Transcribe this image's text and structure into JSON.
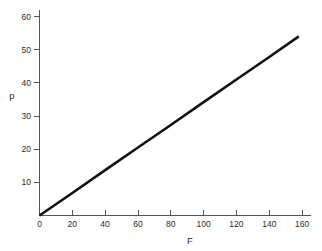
{
  "chart_data": {
    "type": "line",
    "title": "",
    "subtitle": "",
    "xlabel": "F",
    "ylabel": "p",
    "xlim": [
      0,
      165
    ],
    "ylim": [
      0,
      62
    ],
    "xticks": [
      0,
      20,
      40,
      60,
      80,
      100,
      120,
      140,
      160
    ],
    "yticks": [
      0,
      10,
      20,
      30,
      40,
      50,
      60
    ],
    "xticklabels": [
      "0",
      "20",
      "40",
      "60",
      "80",
      "100",
      "120",
      "140",
      "160"
    ],
    "yticklabels": [
      "0",
      "10",
      "20",
      "30",
      "40",
      "50",
      "60"
    ],
    "grid": false,
    "legend": null,
    "annotations": [],
    "series": [
      {
        "name": "p vs F",
        "color": "#111111",
        "x": [
          0,
          20,
          40,
          60,
          80,
          100,
          120,
          140,
          158
        ],
        "values": [
          0,
          6.8,
          13.7,
          20.5,
          27.3,
          34.2,
          41.0,
          47.8,
          54.0
        ]
      }
    ]
  },
  "axes": {
    "y_axis_label": "p",
    "x_axis_label": "F"
  },
  "colors": {
    "background": "#ffffff",
    "data_line": "#111111",
    "axis": "#555555",
    "text": "#2b2b2b"
  }
}
